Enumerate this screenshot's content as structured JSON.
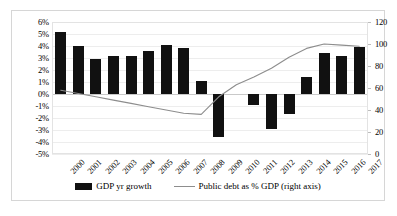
{
  "chart_data": {
    "type": "bar",
    "title": "",
    "subtitle": "",
    "xlabel": "",
    "ylabel": "",
    "categories": [
      "2000",
      "2001",
      "2002",
      "2003",
      "2004",
      "2005",
      "2006",
      "2007",
      "2008",
      "2009",
      "2010",
      "2011",
      "2012",
      "2013",
      "2014",
      "2015",
      "2016",
      "2017"
    ],
    "series": [
      {
        "name": "GDP yr growth",
        "type": "bar",
        "axis": "left",
        "color": "#111111",
        "values": [
          5.2,
          4.0,
          2.9,
          3.2,
          3.2,
          3.6,
          4.1,
          3.8,
          1.1,
          -3.6,
          0.0,
          -0.9,
          -2.9,
          -1.7,
          1.4,
          3.4,
          3.2,
          3.9
        ]
      },
      {
        "name": "Public debt as % GDP (right axis)",
        "type": "line",
        "axis": "right",
        "color": "#8d8d8d",
        "values": [
          58,
          55,
          52,
          49,
          46,
          43,
          40,
          37,
          36,
          52,
          63,
          70,
          78,
          88,
          96,
          100,
          99,
          98
        ]
      }
    ],
    "left_axis": {
      "ticks": [
        "6%",
        "5%",
        "4%",
        "3%",
        "2%",
        "1%",
        "0%",
        "-1%",
        "-2%",
        "-3%",
        "-4%",
        "-5%"
      ],
      "values": [
        6,
        5,
        4,
        3,
        2,
        1,
        0,
        -1,
        -2,
        -3,
        -4,
        -5
      ],
      "min": -5,
      "max": 6
    },
    "right_axis": {
      "ticks": [
        "120",
        "100",
        "80",
        "60",
        "40",
        "20",
        "0"
      ],
      "values": [
        120,
        100,
        80,
        60,
        40,
        20,
        0
      ],
      "min": 0,
      "max": 120
    },
    "grid": true,
    "legend_position": "bottom"
  },
  "legend": {
    "bar_label": "GDP yr growth",
    "line_label": "Public debt as % GDP (right axis)"
  },
  "colors": {
    "bar": "#111111",
    "line": "#8d8d8d",
    "grid": "#ededed",
    "frame": "#d6d6d6"
  }
}
